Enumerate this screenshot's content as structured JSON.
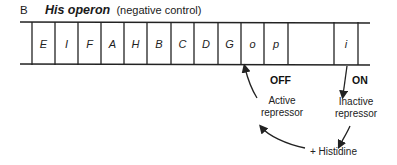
{
  "figure": {
    "panel_label": "B",
    "title": "His operon",
    "subtitle": "(negative control)"
  },
  "operon": {
    "segments": [
      {
        "label": "E",
        "x0": 32,
        "x1": 55
      },
      {
        "label": "I",
        "x0": 55,
        "x1": 78
      },
      {
        "label": "F",
        "x0": 78,
        "x1": 101
      },
      {
        "label": "A",
        "x0": 101,
        "x1": 124
      },
      {
        "label": "H",
        "x0": 124,
        "x1": 147
      },
      {
        "label": "B",
        "x0": 147,
        "x1": 171
      },
      {
        "label": "C",
        "x0": 171,
        "x1": 194
      },
      {
        "label": "D",
        "x0": 194,
        "x1": 218
      },
      {
        "label": "G",
        "x0": 218,
        "x1": 241
      },
      {
        "label": "o",
        "x0": 241,
        "x1": 264
      },
      {
        "label": "p",
        "x0": 264,
        "x1": 288
      },
      {
        "label": "",
        "x0": 288,
        "x1": 334
      },
      {
        "label": "i",
        "x0": 334,
        "x1": 358
      }
    ]
  },
  "annotations": {
    "off_label": "OFF",
    "on_label": "ON",
    "active_repressor_line1": "Active",
    "active_repressor_line2": "repressor",
    "inactive_repressor_line1": "Inactive",
    "inactive_repressor_line2": "repressor",
    "effector": "+ Histidine"
  }
}
